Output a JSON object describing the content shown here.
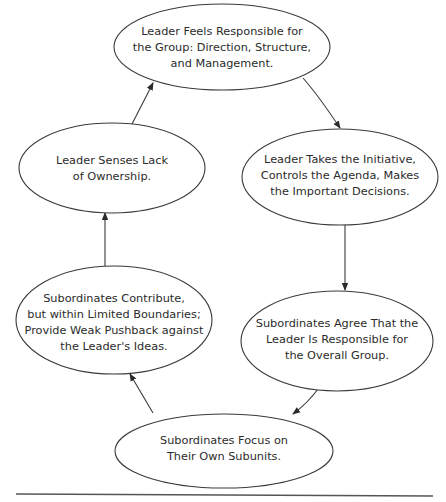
{
  "diagram": {
    "type": "cycle",
    "colors": {
      "stroke": "#3a3a3a",
      "text": "#2b2b2b",
      "background": "#ffffff",
      "rule": "#555555"
    },
    "nodes": [
      {
        "id": "n1",
        "lines": [
          "Leader Feels Responsible for",
          "the Group: Direction, Structure,",
          "and Management."
        ]
      },
      {
        "id": "n2",
        "lines": [
          "Leader Takes the Initiative,",
          "Controls the Agenda, Makes",
          "the Important Decisions."
        ]
      },
      {
        "id": "n3",
        "lines": [
          "Subordinates Agree That the",
          "Leader Is Responsible for",
          "the Overall Group."
        ]
      },
      {
        "id": "n4",
        "lines": [
          "Subordinates Focus on",
          "Their Own Subunits."
        ]
      },
      {
        "id": "n5",
        "lines": [
          "Subordinates Contribute,",
          "but within Limited Boundaries;",
          "Provide Weak Pushback against",
          "the Leader's Ideas."
        ]
      },
      {
        "id": "n6",
        "lines": [
          "Leader Senses Lack",
          "of Ownership."
        ]
      }
    ],
    "edges": [
      {
        "from": "n1",
        "to": "n2"
      },
      {
        "from": "n2",
        "to": "n3"
      },
      {
        "from": "n3",
        "to": "n4"
      },
      {
        "from": "n4",
        "to": "n5"
      },
      {
        "from": "n5",
        "to": "n6"
      },
      {
        "from": "n6",
        "to": "n1"
      }
    ]
  }
}
